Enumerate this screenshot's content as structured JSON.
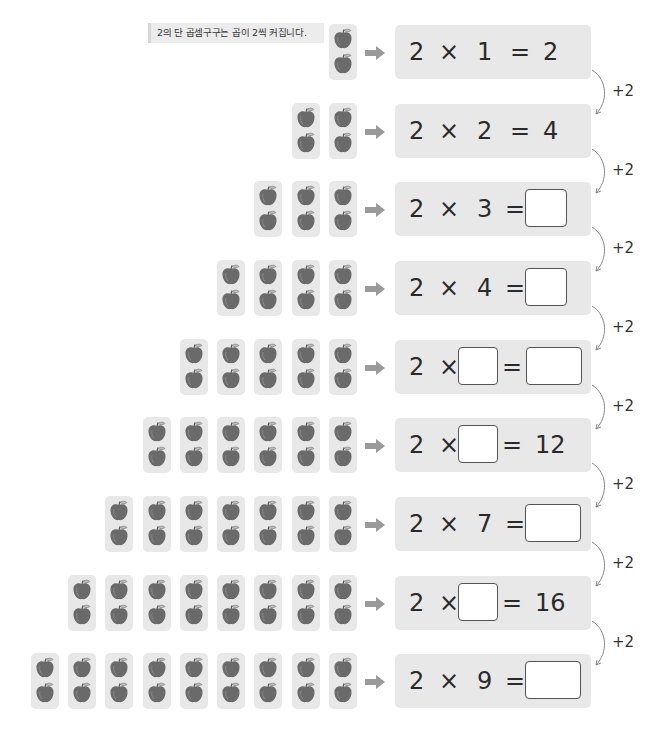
{
  "note": "2의 단 곱셈구구는 곱이 2씩 커집니다.",
  "step_label": "+2",
  "colors": {
    "box_bg": "#e8e8e8",
    "apple": "#6a6a6a",
    "arrow": "#9a9a9a"
  },
  "rows": [
    {
      "groups": 1,
      "tokens": [
        {
          "t": "2"
        },
        {
          "t": "×"
        },
        {
          "t": "1"
        },
        {
          "t": "="
        },
        {
          "t": "2"
        }
      ]
    },
    {
      "groups": 2,
      "tokens": [
        {
          "t": "2"
        },
        {
          "t": "×"
        },
        {
          "t": "2"
        },
        {
          "t": "="
        },
        {
          "t": "4"
        }
      ]
    },
    {
      "groups": 3,
      "tokens": [
        {
          "t": "2"
        },
        {
          "t": "×"
        },
        {
          "t": "3"
        },
        {
          "t": "="
        },
        {
          "blank": "answer"
        }
      ]
    },
    {
      "groups": 4,
      "tokens": [
        {
          "t": "2"
        },
        {
          "t": "×"
        },
        {
          "t": "4"
        },
        {
          "t": "="
        },
        {
          "blank": "answer"
        }
      ]
    },
    {
      "groups": 5,
      "tokens": [
        {
          "t": "2"
        },
        {
          "t": "×"
        },
        {
          "blank": "multiplier"
        },
        {
          "t": "="
        },
        {
          "blank": "answer"
        }
      ]
    },
    {
      "groups": 6,
      "tokens": [
        {
          "t": "2"
        },
        {
          "t": "×"
        },
        {
          "blank": "multiplier"
        },
        {
          "t": "="
        },
        {
          "t": "12"
        }
      ]
    },
    {
      "groups": 7,
      "tokens": [
        {
          "t": "2"
        },
        {
          "t": "×"
        },
        {
          "t": "7"
        },
        {
          "t": "="
        },
        {
          "blank": "answer"
        }
      ]
    },
    {
      "groups": 8,
      "tokens": [
        {
          "t": "2"
        },
        {
          "t": "×"
        },
        {
          "blank": "multiplier"
        },
        {
          "t": "="
        },
        {
          "t": "16"
        }
      ]
    },
    {
      "groups": 9,
      "tokens": [
        {
          "t": "2"
        },
        {
          "t": "×"
        },
        {
          "t": "9"
        },
        {
          "t": "="
        },
        {
          "blank": "answer"
        }
      ]
    }
  ]
}
